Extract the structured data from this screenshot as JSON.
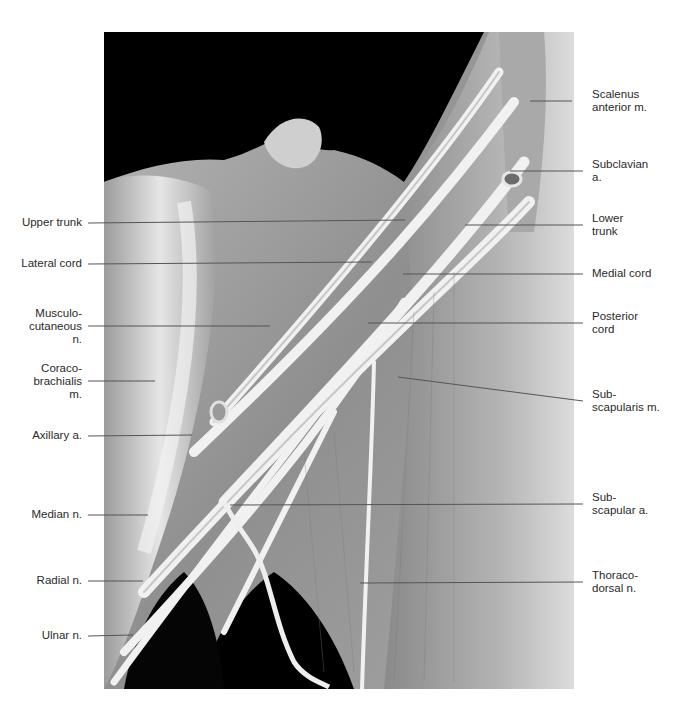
{
  "figure": {
    "type": "labeled dissection photograph",
    "colors": {
      "background": "#ffffff",
      "photo_void": "#000000",
      "leader_line": "#555555",
      "label_text": "#2a2a2a"
    }
  },
  "labels_left": [
    {
      "id": "upper-trunk",
      "text": "Upper trunk",
      "y": 223
    },
    {
      "id": "lateral-cord",
      "text": "Lateral cord",
      "y": 264
    },
    {
      "id": "musculocutaneous-n",
      "text": "Musculo-\ncutaneous\nn.",
      "y": 326
    },
    {
      "id": "coracobrachialis-m",
      "text": "Coraco-\nbrachialis\nm.",
      "y": 381
    },
    {
      "id": "axillary-a",
      "text": "Axillary a.",
      "y": 436
    },
    {
      "id": "median-n",
      "text": "Median n.",
      "y": 515
    },
    {
      "id": "radial-n",
      "text": "Radial n.",
      "y": 581
    },
    {
      "id": "ulnar-n",
      "text": "Ulnar n.",
      "y": 636
    }
  ],
  "labels_right": [
    {
      "id": "scalenus-anterior-m",
      "text": "Scalenus\nanterior m.",
      "y": 101
    },
    {
      "id": "subclavian-a",
      "text": "Subclavian\na.",
      "y": 171
    },
    {
      "id": "lower-trunk",
      "text": "Lower\ntrunk",
      "y": 225
    },
    {
      "id": "medial-cord",
      "text": "Medial cord",
      "y": 274
    },
    {
      "id": "posterior-cord",
      "text": "Posterior\ncord",
      "y": 323
    },
    {
      "id": "subscapularis-m",
      "text": "Sub-\nscapularis m.",
      "y": 401
    },
    {
      "id": "subscapular-a",
      "text": "Sub-\nscapular a.",
      "y": 504
    },
    {
      "id": "thoracodorsal-n",
      "text": "Thoraco-\ndorsal n.",
      "y": 582
    }
  ],
  "caption": {
    "text": "(partially cropped caption text at bottom edge)"
  }
}
